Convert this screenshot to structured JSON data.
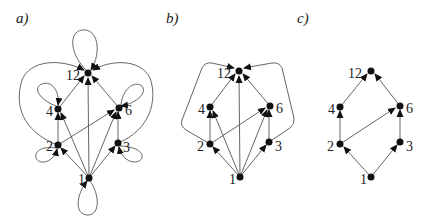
{
  "figure": {
    "panels": [
      {
        "label": "a)",
        "nodes": [
          {
            "id": "1",
            "label": "1"
          },
          {
            "id": "2",
            "label": "2"
          },
          {
            "id": "3",
            "label": "3"
          },
          {
            "id": "4",
            "label": "4"
          },
          {
            "id": "6",
            "label": "6"
          },
          {
            "id": "12",
            "label": "12"
          }
        ],
        "edges": "full divisibility relation with self-loops (reflexive + transitive)"
      },
      {
        "label": "b)",
        "nodes": [
          {
            "id": "1",
            "label": "1"
          },
          {
            "id": "2",
            "label": "2"
          },
          {
            "id": "3",
            "label": "3"
          },
          {
            "id": "4",
            "label": "4"
          },
          {
            "id": "6",
            "label": "6"
          },
          {
            "id": "12",
            "label": "12"
          }
        ],
        "edges": "divisibility relation without self-loops (transitive)"
      },
      {
        "label": "c)",
        "nodes": [
          {
            "id": "1",
            "label": "1"
          },
          {
            "id": "2",
            "label": "2"
          },
          {
            "id": "3",
            "label": "3"
          },
          {
            "id": "4",
            "label": "4"
          },
          {
            "id": "6",
            "label": "6"
          },
          {
            "id": "12",
            "label": "12"
          }
        ],
        "edges": "Hasse diagram (covering relation only)"
      }
    ]
  }
}
